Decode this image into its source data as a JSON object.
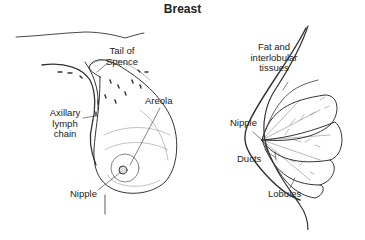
{
  "title": "Breast",
  "left_panel": {
    "labels": {
      "tail_of_spence": [
        "Tail of",
        "Spence"
      ],
      "axillary_lymph_chain": [
        "Axillary",
        "lymph",
        "chain"
      ],
      "areola": "Areola",
      "nipple": "Nipple"
    }
  },
  "right_panel": {
    "labels": {
      "fat_interlobular": [
        "Fat and",
        "interlobular",
        "tissues"
      ],
      "nipple": "Nipple",
      "ducts": "Ducts",
      "lobules": "Lobules"
    }
  },
  "colors": {
    "line": "#333333",
    "background": "#ffffff"
  }
}
